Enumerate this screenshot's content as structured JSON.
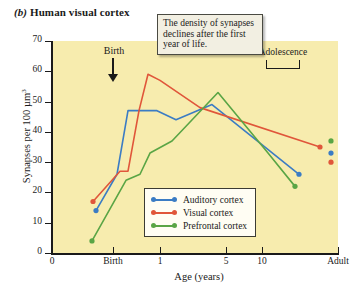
{
  "caption": {
    "letter": "(b)",
    "title": "Human visual cortex"
  },
  "annotation": {
    "text": "The density of synapses declines after the first year of life."
  },
  "markers": {
    "birth_label": "Birth",
    "adolescence_label": "Adolescence"
  },
  "legend": {
    "items": [
      {
        "label": "Auditory cortex",
        "color": "#3b7cc4"
      },
      {
        "label": "Visual cortex",
        "color": "#e0563a"
      },
      {
        "label": "Prefrontal cortex",
        "color": "#5aa545"
      }
    ]
  },
  "chart_data": {
    "type": "line",
    "title": "Human visual cortex",
    "xlabel": "Age (years)",
    "ylabel": "Synapses per 100 µm³",
    "ylim": [
      0,
      70
    ],
    "yticks": [
      0,
      10,
      20,
      30,
      40,
      50,
      60,
      70
    ],
    "ytick_labels": [
      "0",
      "10",
      "20",
      "30",
      "40",
      "50",
      "60",
      "70"
    ],
    "xtick_labels": [
      "0",
      "Birth",
      "1",
      "5",
      "10",
      "Adult"
    ],
    "xtick_px": [
      52,
      113,
      160,
      226,
      262,
      338
    ],
    "grid": false,
    "legend_position": "inside-bottom-right",
    "series": [
      {
        "name": "Auditory cortex",
        "color": "#3b7cc4",
        "points": [
          {
            "x_px": 96,
            "value": 14
          },
          {
            "x_px": 117,
            "value": 26
          },
          {
            "x_px": 128,
            "value": 47
          },
          {
            "x_px": 157,
            "value": 47
          },
          {
            "x_px": 176,
            "value": 44
          },
          {
            "x_px": 212,
            "value": 49
          },
          {
            "x_px": 299,
            "value": 26
          }
        ],
        "adult_marker_value": 33
      },
      {
        "name": "Visual cortex",
        "color": "#e0563a",
        "points": [
          {
            "x_px": 93,
            "value": 17
          },
          {
            "x_px": 120,
            "value": 27
          },
          {
            "x_px": 128,
            "value": 27
          },
          {
            "x_px": 139,
            "value": 47
          },
          {
            "x_px": 148,
            "value": 59
          },
          {
            "x_px": 160,
            "value": 57
          },
          {
            "x_px": 200,
            "value": 48
          },
          {
            "x_px": 320,
            "value": 35
          }
        ],
        "adult_marker_value": 30
      },
      {
        "name": "Prefrontal cortex",
        "color": "#5aa545",
        "points": [
          {
            "x_px": 92,
            "value": 4
          },
          {
            "x_px": 126,
            "value": 24
          },
          {
            "x_px": 140,
            "value": 26
          },
          {
            "x_px": 150,
            "value": 33
          },
          {
            "x_px": 172,
            "value": 37
          },
          {
            "x_px": 218,
            "value": 53
          },
          {
            "x_px": 268,
            "value": 33
          },
          {
            "x_px": 295,
            "value": 22
          }
        ],
        "adult_marker_value": 37
      }
    ]
  }
}
